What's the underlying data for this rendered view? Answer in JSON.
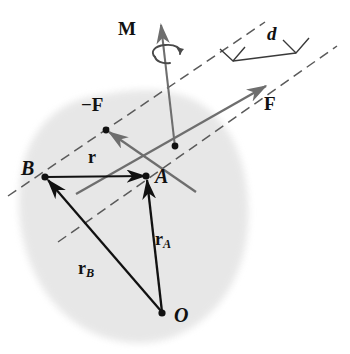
{
  "figure": {
    "width": 350,
    "height": 354,
    "background_color": "#ffffff"
  },
  "colors": {
    "body_fill": "#e6e6e6",
    "black_vector": "#111111",
    "gray_vector": "#6e6e6e",
    "dashed_line": "#5a5a5a",
    "dimension_line": "#3a3a3a",
    "label_text": "#111111"
  },
  "labels": {
    "moment": "M",
    "force_positive": "F",
    "force_negative": "−F",
    "distance": "d",
    "point_a": "A",
    "point_b": "B",
    "point_o": "O",
    "vector_r": "r",
    "vector_ra_main": "r",
    "vector_ra_sub": "A",
    "vector_rb_main": "r",
    "vector_rb_sub": "B"
  },
  "points": {
    "A": {
      "x": 146,
      "y": 176,
      "label": "A"
    },
    "B": {
      "x": 45,
      "y": 177,
      "label": "B"
    },
    "O": {
      "x": 162,
      "y": 313,
      "label": "O"
    },
    "force_application": {
      "x": 175,
      "y": 146
    },
    "neg_force_application": {
      "x": 106,
      "y": 130
    }
  },
  "vectors": [
    {
      "name": "M",
      "label": "M",
      "color": "#6e6e6e",
      "from": {
        "x": 175,
        "y": 146
      },
      "to": {
        "x": 160,
        "y": 22
      },
      "style": "solid-arrow"
    },
    {
      "name": "F",
      "label": "F",
      "color": "#6e6e6e",
      "from": {
        "x": 175,
        "y": 146
      },
      "to": {
        "x": 268,
        "y": 84
      },
      "style": "solid-arrow"
    },
    {
      "name": "-F",
      "label": "−F",
      "color": "#6e6e6e",
      "from": {
        "x": 190,
        "y": 186
      },
      "to": {
        "x": 106,
        "y": 130
      },
      "style": "solid-arrow"
    },
    {
      "name": "r",
      "label": "r",
      "color": "#111111",
      "from": {
        "x": 45,
        "y": 177
      },
      "to": {
        "x": 146,
        "y": 176
      },
      "style": "solid-arrow"
    },
    {
      "name": "rA",
      "label": "rA",
      "color": "#111111",
      "from": {
        "x": 162,
        "y": 313
      },
      "to": {
        "x": 146,
        "y": 176
      },
      "style": "solid-arrow"
    },
    {
      "name": "rB",
      "label": "rB",
      "color": "#111111",
      "from": {
        "x": 162,
        "y": 313
      },
      "to": {
        "x": 45,
        "y": 177
      },
      "style": "solid-arrow"
    }
  ],
  "dashed_lines": [
    {
      "name": "line-of-action-neg-F",
      "from": {
        "x": 8,
        "y": 196
      },
      "to": {
        "x": 265,
        "y": 22
      }
    },
    {
      "name": "line-of-action-F",
      "from": {
        "x": 58,
        "y": 242
      },
      "to": {
        "x": 337,
        "y": 46
      }
    }
  ],
  "dimension": {
    "label": "d",
    "description": "perpendicular distance between the two lines of action",
    "from": {
      "x": 233,
      "y": 60
    },
    "to": {
      "x": 298,
      "y": 52
    },
    "right_angle_markers": 2
  },
  "body": {
    "name": "rigid-body-blob",
    "fill": "#e6e6e6",
    "description": "irregular light gray rigid body outline"
  },
  "rotation_indicator": {
    "name": "moment-rotation-arrow",
    "description": "curved counterclockwise arrow around the M vector shaft",
    "center": {
      "x": 166,
      "y": 60
    }
  }
}
